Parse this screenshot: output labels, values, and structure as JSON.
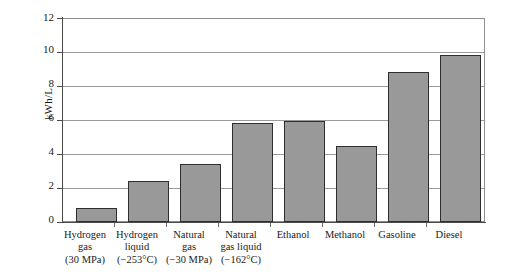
{
  "chart_data": {
    "type": "bar",
    "title": "",
    "subtitle": "",
    "xlabel": "",
    "ylabel": "kWh/L",
    "ylim": [
      0,
      12
    ],
    "ytick_values": [
      0,
      2,
      4,
      6,
      8,
      10,
      12
    ],
    "ytick_labels": [
      "0",
      "2",
      "4",
      "6",
      "8",
      "10",
      "12"
    ],
    "grid": "horizontal",
    "legend": "none",
    "bar_color": "#999999",
    "bar_edge_color": "#2e2e2e",
    "background_color": "#ffffff",
    "gridline_color": "#9a9a9a",
    "axis_color": "#4a4a4a",
    "categories": [
      "Hydrogen gas (30 MPa)",
      "Hydrogen liquid (−253°C)",
      "Natural gas (−30 MPa)",
      "Natural gas liquid (−162°C)",
      "Ethanol",
      "Methanol",
      "Gasoline",
      "Diesel"
    ],
    "category_label_lines": [
      [
        "Hydrogen",
        "gas",
        "(30 MPa)"
      ],
      [
        "Hydrogen",
        "liquid",
        "(−253°C)"
      ],
      [
        "Natural",
        "gas",
        "(−30 MPa)"
      ],
      [
        "Natural",
        "gas liquid",
        "(−162°C)"
      ],
      [
        "Ethanol"
      ],
      [
        "Methanol"
      ],
      [
        "Gasoline"
      ],
      [
        "Diesel"
      ]
    ],
    "values": [
      0.8,
      2.4,
      3.4,
      5.85,
      5.95,
      4.5,
      8.8,
      9.8
    ],
    "units": "kWh/L"
  }
}
